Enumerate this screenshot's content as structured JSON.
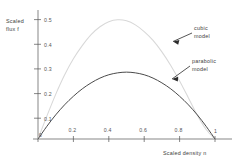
{
  "chart_data": {
    "type": "line",
    "title": "",
    "xlabel": "Scaled density n",
    "ylabel": "Scaled flux f",
    "xlim": [
      0,
      1.02
    ],
    "ylim": [
      0,
      0.53
    ],
    "grid": false,
    "legend_position": "inline-annotations",
    "xticks": [
      0.2,
      0.4,
      0.6,
      0.8
    ],
    "xtick_labels": [
      "0.2",
      "0.4",
      "0.6",
      "0.8"
    ],
    "yticks": [
      0.1,
      0.2,
      0.3,
      0.4,
      0.5
    ],
    "ytick_labels": [
      "0.1",
      "0.2",
      "0.3",
      "0.4",
      "0.5"
    ],
    "origin_label": "0",
    "xmax_label": "1",
    "series": [
      {
        "name": "cubic model",
        "color": "#d8d8d8",
        "peak_x": 0.43,
        "peak_y": 0.5,
        "x": [
          0.0,
          0.05,
          0.1,
          0.15,
          0.2,
          0.25,
          0.3,
          0.35,
          0.4,
          0.45,
          0.5,
          0.55,
          0.6,
          0.65,
          0.7,
          0.75,
          0.8,
          0.85,
          0.9,
          0.95,
          1.0
        ],
        "values": [
          0.0,
          0.096,
          0.187,
          0.268,
          0.336,
          0.391,
          0.437,
          0.47,
          0.491,
          0.499,
          0.495,
          0.478,
          0.45,
          0.413,
          0.365,
          0.308,
          0.243,
          0.172,
          0.1,
          0.04,
          0.0
        ]
      },
      {
        "name": "parabolic model",
        "color": "#4a4a4a",
        "peak_x": 0.5,
        "peak_y": 0.28,
        "x": [
          0.0,
          0.05,
          0.1,
          0.15,
          0.2,
          0.25,
          0.3,
          0.35,
          0.4,
          0.45,
          0.5,
          0.55,
          0.6,
          0.65,
          0.7,
          0.75,
          0.8,
          0.85,
          0.9,
          0.95,
          1.0
        ],
        "values": [
          0.0,
          0.053,
          0.101,
          0.143,
          0.179,
          0.21,
          0.235,
          0.255,
          0.269,
          0.277,
          0.28,
          0.277,
          0.269,
          0.255,
          0.235,
          0.21,
          0.179,
          0.143,
          0.101,
          0.053,
          0.0
        ]
      }
    ],
    "annotations": [
      {
        "id": "cubic",
        "text_line1": "cubic",
        "text_line2": "model"
      },
      {
        "id": "parabolic",
        "text_line1": "parabolic",
        "text_line2": "model"
      }
    ]
  },
  "axis": {
    "y_title_line1": "Scaled",
    "y_title_line2": "flux  f",
    "x_title": "Scaled density n"
  }
}
